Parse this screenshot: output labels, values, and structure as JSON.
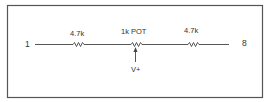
{
  "diagram": {
    "type": "schematic",
    "nodes": {
      "left_terminal": "1",
      "right_terminal": "8",
      "wiper_supply": "V+"
    },
    "components": [
      {
        "id": "R1",
        "label": "4.7k",
        "kind": "resistor"
      },
      {
        "id": "POT",
        "label": "1k POT",
        "kind": "potentiometer"
      },
      {
        "id": "R2",
        "label": "4.7k",
        "kind": "resistor"
      }
    ],
    "colors": {
      "line": "#444444",
      "border": "#555555",
      "text": "#333333",
      "background": "#ffffff"
    }
  }
}
